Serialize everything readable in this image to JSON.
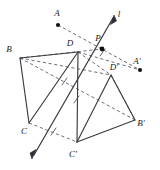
{
  "figure": {
    "type": "geometry-diagram",
    "width": 160,
    "height": 170,
    "background_color": "#ffffff",
    "stroke_color": "#3a3a42",
    "dash_color": "#55555e",
    "label_color": "#1a1a1a"
  },
  "labels": {
    "A": "A",
    "B": "B",
    "C": "C",
    "D": "D",
    "A_prime": "A'",
    "B_prime": "B'",
    "C_prime": "C'",
    "D_prime": "D'",
    "P": "P",
    "line": "l"
  },
  "label_positions": {
    "A": {
      "x": 57,
      "y": 16
    },
    "B": {
      "x": 9,
      "y": 52
    },
    "C": {
      "x": 24,
      "y": 134
    },
    "D": {
      "x": 70,
      "y": 46
    },
    "A_prime": {
      "x": 137,
      "y": 64
    },
    "B_prime": {
      "x": 139,
      "y": 126
    },
    "C_prime": {
      "x": 72,
      "y": 157
    },
    "D_prime": {
      "x": 112,
      "y": 70
    },
    "P": {
      "x": 97,
      "y": 41
    },
    "line": {
      "x": 118,
      "y": 16
    }
  },
  "points": {
    "A": {
      "x": 58,
      "y": 25,
      "dot": true
    },
    "B": {
      "x": 20,
      "y": 58,
      "dot": false
    },
    "C": {
      "x": 29,
      "y": 123,
      "dot": false
    },
    "D": {
      "x": 78,
      "y": 52,
      "dot": false
    },
    "A_prime": {
      "x": 140,
      "y": 70,
      "dot": true
    },
    "B_prime": {
      "x": 135,
      "y": 120,
      "dot": false
    },
    "C_prime": {
      "x": 77,
      "y": 142,
      "dot": false
    },
    "D_prime": {
      "x": 111,
      "y": 75,
      "dot": false
    },
    "P": {
      "x": 102,
      "y": 49,
      "dot": true
    }
  },
  "line_l": {
    "from": {
      "x": 33,
      "y": 157
    },
    "to": {
      "x": 114,
      "y": 16
    },
    "arrow_start": true,
    "arrow_end": true
  },
  "solid_edges": [
    {
      "name": "edge-B-D",
      "from": "B",
      "to": "D"
    },
    {
      "name": "edge-B-C",
      "from": "B",
      "to": "C"
    },
    {
      "name": "edge-C-D",
      "from": "C",
      "to": "D"
    },
    {
      "name": "edge-D-prime-B-prime",
      "from": "D_prime",
      "to": "B_prime"
    },
    {
      "name": "edge-D-prime-C-prime",
      "from": "D_prime",
      "to": "C_prime"
    },
    {
      "name": "edge-C-prime-B-prime",
      "from": "C_prime",
      "to": "B_prime"
    }
  ],
  "dashed_edges": [
    {
      "name": "connector-A-A-prime",
      "from": "A",
      "to": "A_prime",
      "tick": false
    },
    {
      "name": "connector-B-B-prime",
      "from": "B",
      "to": "B_prime",
      "tick": true
    },
    {
      "name": "connector-C-C-prime",
      "from": "C",
      "to": "C_prime",
      "tick": true
    },
    {
      "name": "connector-D-D-prime",
      "from": "D",
      "to": "D_prime",
      "tick": true
    },
    {
      "name": "diagonal-B-D",
      "from": "B",
      "to": "D",
      "tick": false
    },
    {
      "name": "diagonal-D-prime-B-prime",
      "from": "D_prime",
      "to": "B_prime",
      "tick": false
    }
  ]
}
